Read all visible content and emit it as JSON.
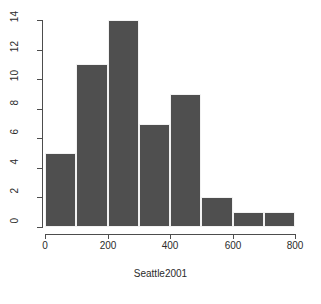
{
  "chart_data": {
    "type": "bar",
    "title": "",
    "subtitle": "",
    "xlabel": "Seattle2001",
    "ylabel": "",
    "grid": false,
    "legend": null,
    "bin_width": 100,
    "bin_edges": [
      0,
      100,
      200,
      300,
      400,
      500,
      600,
      700,
      800
    ],
    "categories": [
      "0-100",
      "100-200",
      "200-300",
      "300-400",
      "400-500",
      "500-600",
      "600-700",
      "700-800"
    ],
    "x": [
      50,
      150,
      250,
      350,
      450,
      550,
      650,
      750
    ],
    "values": [
      5,
      11,
      14,
      7,
      9,
      2,
      1,
      1
    ],
    "xlim": [
      0,
      800
    ],
    "ylim": [
      0,
      14
    ],
    "xticks": [
      0,
      200,
      400,
      600,
      800
    ],
    "xtick_labels": [
      "0",
      "200",
      "400",
      "600",
      "800"
    ],
    "yticks": [
      0,
      2,
      4,
      6,
      8,
      10,
      12,
      14
    ],
    "ytick_labels": [
      "0",
      "2",
      "4",
      "6",
      "8",
      "10",
      "12",
      "14"
    ],
    "bar_color": "#4f4f4f",
    "bar_border_color": "#f2f2f2",
    "axis_color": "#4d4d4d",
    "background_color": "#ffffff"
  }
}
